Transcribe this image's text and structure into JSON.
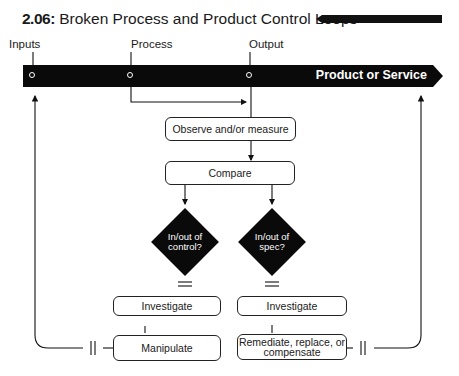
{
  "title": {
    "number": "2.06:",
    "text": "Broken Process and Product Control Loops"
  },
  "stages": {
    "inputs": "Inputs",
    "process": "Process",
    "output": "Output"
  },
  "band": {
    "label": "Product or Service"
  },
  "steps": {
    "observe": "Observe and/or measure",
    "compare": "Compare",
    "decision_control": [
      "In/out of",
      "control?"
    ],
    "decision_spec": [
      "In/out of",
      "spec?"
    ],
    "investigate_left": "Investigate",
    "investigate_right": "Investigate",
    "manipulate": "Manipulate",
    "remediate": [
      "Remediate, replace, or",
      "compensate"
    ]
  }
}
